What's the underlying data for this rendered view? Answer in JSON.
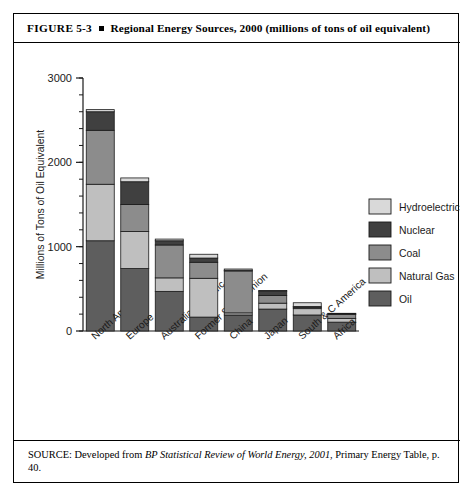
{
  "figure": {
    "label": "FIGURE",
    "number": "5-3",
    "title": "Regional Energy Sources, 2000 (millions of tons of oil equivalent)"
  },
  "source": {
    "prefix": "SOURCE: Developed from ",
    "italic": "BP Statistical Review of World Energy, 2001",
    "suffix": ", Primary Energy Table, p. 40."
  },
  "colors": {
    "hydroelectric": "#d9d9d9",
    "nuclear": "#404040",
    "coal": "#8c8c8c",
    "natural_gas": "#bfbfbf",
    "oil": "#5e5e5e",
    "axis": "#1a1a1a",
    "stroke": "#1a1a1a"
  },
  "chart_data": {
    "type": "bar",
    "stacked": true,
    "title": "Regional Energy Sources, 2000 (millions of tons of oil equivalent)",
    "xlabel": "",
    "ylabel": "Millions of Tons of Oil Equivalent",
    "ylim": [
      0,
      3000
    ],
    "yticks": [
      0,
      1000,
      2000,
      3000
    ],
    "ytick_labels": [
      "0",
      "1000",
      "2000",
      "3000"
    ],
    "minor_tick_step": 200,
    "grid": false,
    "legend_position": "right",
    "categories": [
      "North America",
      "Europe",
      "Australia & Pacific",
      "Former Soviet Union",
      "China",
      "Japan",
      "South & C America",
      "Africa"
    ],
    "series": [
      {
        "name": "Oil",
        "color": "#5e5e5e",
        "values": [
          1070,
          740,
          470,
          165,
          190,
          260,
          190,
          105
        ]
      },
      {
        "name": "Natural Gas",
        "color": "#bfbfbf",
        "values": [
          670,
          440,
          160,
          460,
          25,
          70,
          75,
          45
        ]
      },
      {
        "name": "Coal",
        "color": "#8c8c8c",
        "values": [
          640,
          320,
          390,
          190,
          500,
          90,
          20,
          50
        ]
      },
      {
        "name": "Nuclear",
        "color": "#404040",
        "values": [
          220,
          270,
          50,
          50,
          5,
          55,
          5,
          5
        ]
      },
      {
        "name": "Hydroelectric",
        "color": "#d9d9d9",
        "values": [
          25,
          45,
          20,
          45,
          15,
          5,
          45,
          5
        ]
      }
    ],
    "totals": [
      2625,
      1815,
      1090,
      910,
      735,
      480,
      335,
      210
    ],
    "legend_order": [
      "Hydroelectric",
      "Nuclear",
      "Coal",
      "Natural Gas",
      "Oil"
    ]
  }
}
